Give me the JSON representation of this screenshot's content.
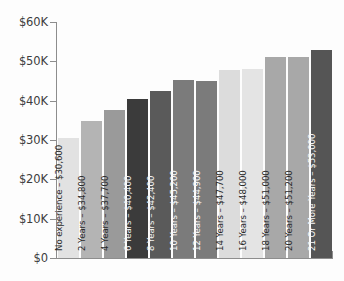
{
  "chart_data": {
    "type": "bar",
    "title": "",
    "subtitle": "",
    "xlabel": "",
    "ylabel": "",
    "ylim": [
      0,
      60000
    ],
    "grid": false,
    "legend": null,
    "orientation": "vertical",
    "y_tick_labels": [
      "$60K",
      "$50K",
      "$40K",
      "$30K",
      "$20K",
      "$10K",
      "$0"
    ],
    "y_tick_values": [
      60000,
      50000,
      40000,
      30000,
      20000,
      10000,
      0
    ],
    "categories": [
      "No experience",
      "2 Years",
      "4 Years",
      "6 Years",
      "8 Years",
      "10 Years",
      "12 Years",
      "14 Years",
      "16 Years",
      "18 Years",
      "20 Years",
      "21 Or More Years"
    ],
    "values": [
      30600,
      34800,
      37700,
      40400,
      42400,
      45200,
      44900,
      47700,
      48000,
      51000,
      51200,
      53000
    ],
    "value_labels": [
      "$30,600",
      "$34,800",
      "$37,700",
      "$40,400",
      "$42,400",
      "$45,200",
      "$44,900",
      "$47,700",
      "$48,000",
      "$51,000",
      "$51,200",
      "$53,000"
    ],
    "bars": [
      {
        "label": "No experience – $30,600",
        "category": "No experience",
        "value": 30600,
        "color": "#e2e2e2",
        "text_color": "#2b2b2b"
      },
      {
        "label": "2 Years – $34,800",
        "category": "2 Years",
        "value": 34800,
        "color": "#b4b4b4",
        "text_color": "#2b2b2b"
      },
      {
        "label": "4 Years – $37,700",
        "category": "4 Years",
        "value": 37700,
        "color": "#9a9a9a",
        "text_color": "#2b2b2b"
      },
      {
        "label": "6 Years – $40,400",
        "category": "6 Years",
        "value": 40400,
        "color": "#3b3b3b",
        "text_color": "#f2f2f2"
      },
      {
        "label": "8 Years – $42,400",
        "category": "8 Years",
        "value": 42400,
        "color": "#5a5a5a",
        "text_color": "#f2f2f2"
      },
      {
        "label": "10 Years – $45,200",
        "category": "10 Years",
        "value": 45200,
        "color": "#7b7b7b",
        "text_color": "#f7f7f7"
      },
      {
        "label": "12 Years – $44,900",
        "category": "12 Years",
        "value": 44900,
        "color": "#7b7b7b",
        "text_color": "#f7f7f7"
      },
      {
        "label": "14 Years – $47,700",
        "category": "14 Years",
        "value": 47700,
        "color": "#dcdcdc",
        "text_color": "#2b2b2b"
      },
      {
        "label": "16 Years – $48,000",
        "category": "16 Years",
        "value": 48000,
        "color": "#e4e4e4",
        "text_color": "#2b2b2b"
      },
      {
        "label": "18 Years – $51,000",
        "category": "18 Years",
        "value": 51000,
        "color": "#a8a8a8",
        "text_color": "#2b2b2b"
      },
      {
        "label": "20 Years – $51,200",
        "category": "20 Years",
        "value": 51200,
        "color": "#a8a8a8",
        "text_color": "#2b2b2b"
      },
      {
        "label": "21 Or More Years – $53,000",
        "category": "21 Or More Years",
        "value": 53000,
        "color": "#555555",
        "text_color": "#f7f7f7"
      }
    ],
    "axis_color": "#8d8d8d",
    "background_color": "#fdfdfd"
  }
}
